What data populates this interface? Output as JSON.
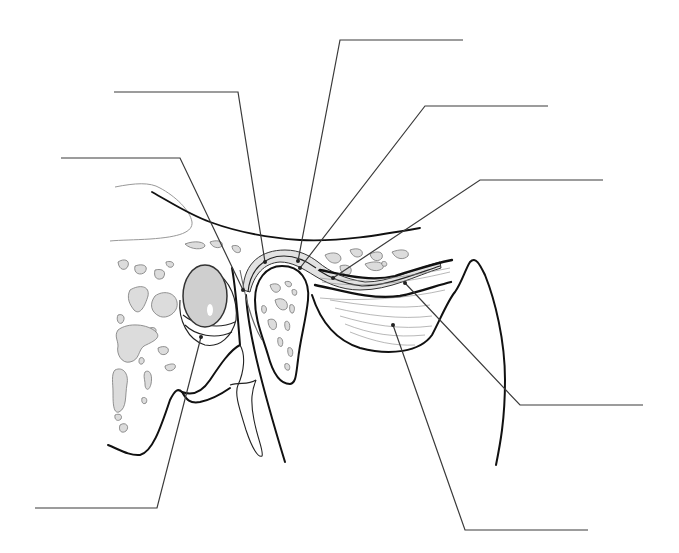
{
  "diagram": {
    "title": "",
    "labels": [
      {
        "id": "label-1",
        "text": "",
        "anchor": [
          298,
          261
        ],
        "elbow": [
          340,
          40
        ],
        "end": [
          463,
          40
        ]
      },
      {
        "id": "label-2",
        "text": "",
        "anchor": [
          265,
          262
        ],
        "elbow": [
          238,
          92
        ],
        "end": [
          114,
          92
        ]
      },
      {
        "id": "label-3",
        "text": "",
        "anchor": [
          300,
          268
        ],
        "elbow": [
          425,
          106
        ],
        "end": [
          548,
          106
        ]
      },
      {
        "id": "label-4",
        "text": "",
        "anchor": [
          243,
          290
        ],
        "elbow": [
          180,
          158
        ],
        "end": [
          61,
          158
        ]
      },
      {
        "id": "label-5",
        "text": "",
        "anchor": [
          333,
          278
        ],
        "elbow": [
          480,
          180
        ],
        "end": [
          603,
          180
        ]
      },
      {
        "id": "label-6",
        "text": "",
        "anchor": [
          405,
          283
        ],
        "elbow": [
          520,
          405
        ],
        "end": [
          643,
          405
        ]
      },
      {
        "id": "label-7",
        "text": "",
        "anchor": [
          393,
          325
        ],
        "elbow": [
          465,
          530
        ],
        "end": [
          588,
          530
        ]
      },
      {
        "id": "label-8",
        "text": "",
        "anchor": [
          201,
          337
        ],
        "elbow": [
          157,
          508
        ],
        "end": [
          35,
          508
        ]
      }
    ],
    "colors": {
      "line": "#3a3a3a",
      "outline": "#111111",
      "bone_fill": "#dcdcdc",
      "disc_fill": "#e2e2e2",
      "ear_canal_fill": "#cfcfcf"
    }
  }
}
